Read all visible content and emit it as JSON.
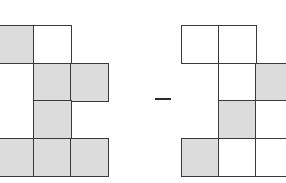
{
  "figure": {
    "operator": "minus",
    "colors": {
      "shaded": "#dcdcdc",
      "unshaded": "#ffffff",
      "border": "#3a3a3a"
    },
    "left_shape": {
      "origin_x": -4,
      "origin_y": 25,
      "cell_w": 37,
      "cell_h": 37.5,
      "cells": [
        {
          "row": 0,
          "col": 0,
          "shaded": true
        },
        {
          "row": 0,
          "col": 1,
          "shaded": false
        },
        {
          "row": 1,
          "col": 1,
          "shaded": true
        },
        {
          "row": 1,
          "col": 2,
          "shaded": true
        },
        {
          "row": 2,
          "col": 1,
          "shaded": true
        },
        {
          "row": 3,
          "col": 0,
          "shaded": true
        },
        {
          "row": 3,
          "col": 1,
          "shaded": true
        },
        {
          "row": 3,
          "col": 2,
          "shaded": true
        }
      ]
    },
    "right_shape": {
      "origin_x": 181,
      "origin_y": 25,
      "cell_w": 37,
      "cell_h": 37.5,
      "cells": [
        {
          "row": 0,
          "col": 0,
          "shaded": false
        },
        {
          "row": 0,
          "col": 1,
          "shaded": false
        },
        {
          "row": 1,
          "col": 1,
          "shaded": false
        },
        {
          "row": 1,
          "col": 2,
          "shaded": true
        },
        {
          "row": 2,
          "col": 1,
          "shaded": true
        },
        {
          "row": 2,
          "col": 2,
          "shaded": false
        },
        {
          "row": 3,
          "col": 0,
          "shaded": true
        },
        {
          "row": 3,
          "col": 1,
          "shaded": false
        },
        {
          "row": 3,
          "col": 2,
          "shaded": false
        }
      ]
    },
    "minus_sign": {
      "x": 155,
      "y": 98,
      "width": 16
    }
  }
}
